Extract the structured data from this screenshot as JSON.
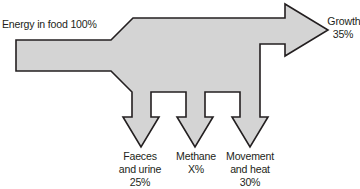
{
  "diagram": {
    "input": {
      "label": "Energy in food 100%"
    },
    "outputs": [
      {
        "id": "growth",
        "lines": [
          "Growth",
          "35%"
        ],
        "value": "35%"
      },
      {
        "id": "faeces",
        "lines": [
          "Faeces",
          "and urine",
          "25%"
        ],
        "value": "25%"
      },
      {
        "id": "methane",
        "lines": [
          "Methane",
          "X%"
        ],
        "value": "X%"
      },
      {
        "id": "movement",
        "lines": [
          "Movement",
          "and heat",
          "30%"
        ],
        "value": "30%"
      }
    ],
    "colors": {
      "fill": "#d4d4d4",
      "stroke": "#231f20",
      "text": "#231f20",
      "background": "#ffffff"
    }
  }
}
